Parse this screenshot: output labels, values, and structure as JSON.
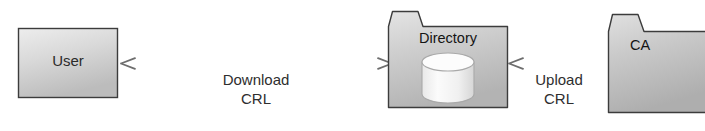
{
  "diagram": {
    "type": "flow-diagram",
    "background_color": "#ffffff",
    "nodes": [
      {
        "id": "user",
        "label": "User",
        "shape": "rectangle",
        "fill_color": "#d6d6d6",
        "border_color": "#3a3a3a"
      },
      {
        "id": "directory",
        "label": "Directory",
        "shape": "folder",
        "fill_color": "#c8c8c8",
        "border_color": "#3a3a3a",
        "inner_icon": "database-cylinder-icon"
      },
      {
        "id": "ca",
        "label": "CA",
        "shape": "folder",
        "fill_color": "#c4c4c4",
        "border_color": "#3a3a3a"
      }
    ],
    "edges": [
      {
        "id": "download-crl",
        "from": "directory",
        "to": "user",
        "label_line1": "Download",
        "label_line2": "CRL",
        "direction": "bidirectional",
        "line_color": "#6b6b6b"
      },
      {
        "id": "upload-crl",
        "from": "ca",
        "to": "directory",
        "label_line1": "Upload",
        "label_line2": "CRL",
        "direction": "left",
        "line_color": "#6b6b6b"
      }
    ]
  }
}
